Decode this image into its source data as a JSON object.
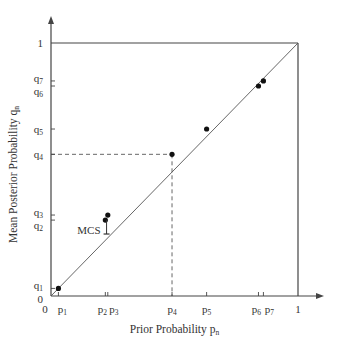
{
  "chart_data": {
    "type": "scatter",
    "title": "",
    "xlabel": "Prior Probability p_n",
    "ylabel": "Mean Posterior Probability q_n",
    "xlim": [
      0,
      1
    ],
    "ylim": [
      0,
      1
    ],
    "grid": false,
    "legend": null,
    "reference_line": {
      "type": "diagonal",
      "from": [
        0,
        0
      ],
      "to": [
        1,
        1
      ]
    },
    "points": [
      {
        "label": "1",
        "x": 0.03,
        "y": 0.03
      },
      {
        "label": "2",
        "x": 0.22,
        "y": 0.3
      },
      {
        "label": "3",
        "x": 0.23,
        "y": 0.32
      },
      {
        "label": "4",
        "x": 0.49,
        "y": 0.56
      },
      {
        "label": "5",
        "x": 0.63,
        "y": 0.66
      },
      {
        "label": "6",
        "x": 0.84,
        "y": 0.83
      },
      {
        "label": "7",
        "x": 0.86,
        "y": 0.85
      }
    ],
    "x_tick_labels": [
      "0",
      "p1",
      "p2",
      "p3",
      "p4",
      "p5",
      "p6",
      "p7",
      "1"
    ],
    "y_tick_labels": [
      "0",
      "q1",
      "q2",
      "q3",
      "q4",
      "q5",
      "q6",
      "q7",
      "1"
    ],
    "annotations": [
      {
        "text": "MCS",
        "x": 0.23,
        "y": 0.24,
        "note": "marker on diagonal below p2/p3 points"
      },
      {
        "text": "dashed guide lines from point 4 to both axes"
      }
    ]
  },
  "labels": {
    "x_title_main": "Prior Probability p",
    "x_title_sub": "n",
    "y_title_main": "Mean Posterior Probability q",
    "y_title_sub": "n",
    "mcs": "MCS",
    "zero_x": "0",
    "zero_y": "0",
    "one_x": "1",
    "one_y": "1",
    "p": "p",
    "q": "q",
    "subs": [
      "1",
      "2",
      "3",
      "4",
      "5",
      "6",
      "7"
    ]
  }
}
